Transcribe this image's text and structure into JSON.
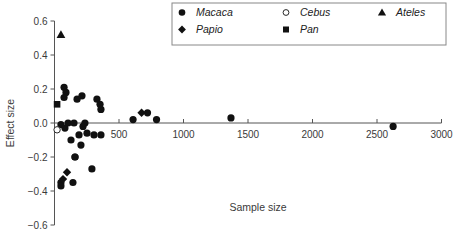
{
  "chart_data": {
    "type": "scatter",
    "title": "",
    "xlabel": "Sample size",
    "ylabel": "Effect size",
    "xlim": [
      0,
      3000
    ],
    "ylim": [
      -0.6,
      0.6
    ],
    "xticks": [
      500,
      1000,
      1500,
      2000,
      2500,
      3000
    ],
    "xtick_labels": [
      "500",
      "1000",
      "1500",
      "2000",
      "2500",
      "3000"
    ],
    "yticks": [
      -0.6,
      -0.4,
      -0.2,
      0.0,
      0.2,
      0.4,
      0.6
    ],
    "ytick_labels": [
      "−0.6",
      "−0.4",
      "−0.2",
      "0.0",
      "0.2",
      "0.4",
      "0.6"
    ],
    "grid": false,
    "legend_position": "top-right",
    "series": [
      {
        "name": "Macaca",
        "marker": "filled-circle",
        "points": [
          [
            74,
            0.21
          ],
          [
            89,
            0.18
          ],
          [
            74,
            0.15
          ],
          [
            175,
            0.14
          ],
          [
            213,
            0.16
          ],
          [
            329,
            0.14
          ],
          [
            353,
            0.11
          ],
          [
            360,
            0.08
          ],
          [
            50,
            -0.01
          ],
          [
            81,
            -0.03
          ],
          [
            105,
            0.0
          ],
          [
            151,
            0.0
          ],
          [
            221,
            -0.02
          ],
          [
            236,
            0.0
          ],
          [
            128,
            -0.1
          ],
          [
            190,
            -0.07
          ],
          [
            252,
            -0.06
          ],
          [
            306,
            -0.07
          ],
          [
            360,
            -0.07
          ],
          [
            205,
            -0.13
          ],
          [
            159,
            -0.2
          ],
          [
            159,
            -0.2
          ],
          [
            290,
            -0.27
          ],
          [
            143,
            -0.35
          ],
          [
            50,
            -0.35
          ],
          [
            50,
            -0.37
          ],
          [
            609,
            0.02
          ],
          [
            721,
            0.06
          ],
          [
            791,
            0.02
          ],
          [
            1368,
            0.03
          ],
          [
            2625,
            -0.02
          ]
        ]
      },
      {
        "name": "Papio",
        "marker": "filled-diamond",
        "points": [
          [
            97,
            -0.29
          ],
          [
            66,
            -0.33
          ],
          [
            675,
            0.06
          ]
        ]
      },
      {
        "name": "Cebus",
        "marker": "open-circle",
        "points": [
          [
            20,
            -0.04
          ]
        ]
      },
      {
        "name": "Pan",
        "marker": "filled-square",
        "points": [
          [
            20,
            0.11
          ]
        ]
      },
      {
        "name": "Ateles",
        "marker": "filled-triangle",
        "points": [
          [
            50,
            0.52
          ]
        ]
      }
    ],
    "legend": [
      {
        "label": "Macaca",
        "marker": "filled-circle"
      },
      {
        "label": "Cebus",
        "marker": "open-circle"
      },
      {
        "label": "Ateles",
        "marker": "filled-triangle"
      },
      {
        "label": "Papio",
        "marker": "filled-diamond"
      },
      {
        "label": "Pan",
        "marker": "filled-square"
      }
    ]
  },
  "colors": {
    "marker": "#111111",
    "axis": "#555555",
    "text": "#3a3a3a"
  }
}
